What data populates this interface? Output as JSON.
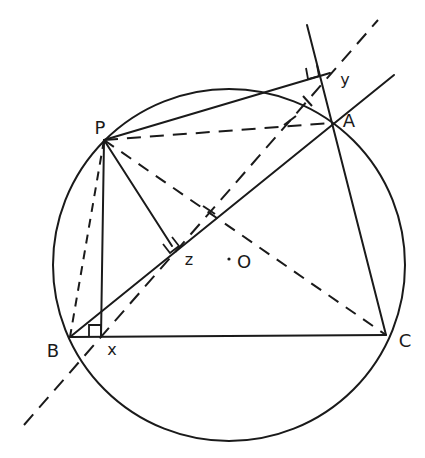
{
  "diagram": {
    "stroke_color": "#1a1a1a",
    "background": "#ffffff",
    "circle": {
      "cx": 229,
      "cy": 265,
      "r": 176,
      "name": "circumcircle"
    },
    "center": {
      "x": 229,
      "y": 259,
      "label": "O",
      "label_x": 244,
      "label_y": 262
    },
    "points": [
      {
        "id": "P",
        "x": 104,
        "y": 140,
        "label": "P",
        "label_x": 100,
        "label_y": 128
      },
      {
        "id": "A",
        "x": 332,
        "y": 123,
        "label": "A",
        "label_x": 349,
        "label_y": 121
      },
      {
        "id": "B",
        "x": 70,
        "y": 337,
        "label": "B",
        "label_x": 53,
        "label_y": 351
      },
      {
        "id": "C",
        "x": 386,
        "y": 335,
        "label": "C",
        "label_x": 405,
        "label_y": 341
      },
      {
        "id": "X",
        "x": 101,
        "y": 337,
        "label": "x",
        "label_x": 112,
        "label_y": 350
      },
      {
        "id": "Y",
        "x": 330,
        "y": 73,
        "label": "y",
        "label_x": 345,
        "label_y": 80
      },
      {
        "id": "Z",
        "x": 172,
        "y": 246,
        "label": "z",
        "label_x": 189,
        "label_y": 260
      }
    ],
    "solid_lines": [
      {
        "name": "side-bc",
        "x1": 70,
        "y1": 337,
        "x2": 386,
        "y2": 335
      },
      {
        "name": "side-ab-extended",
        "x1": 70,
        "y1": 337,
        "x2": 394,
        "y2": 75
      },
      {
        "name": "side-ca-extended",
        "x1": 386,
        "y1": 335,
        "x2": 307,
        "y2": 25
      },
      {
        "name": "perp-px",
        "x1": 104,
        "y1": 140,
        "x2": 101,
        "y2": 337
      },
      {
        "name": "perp-pz",
        "x1": 104,
        "y1": 140,
        "x2": 172,
        "y2": 246
      },
      {
        "name": "perp-py",
        "x1": 104,
        "y1": 140,
        "x2": 330,
        "y2": 73
      }
    ],
    "dashed_lines": [
      {
        "name": "simson-line",
        "x1": 24,
        "y1": 425,
        "x2": 378,
        "y2": 20,
        "dash": "14 9"
      },
      {
        "name": "chord-pa",
        "x1": 104,
        "y1": 140,
        "x2": 332,
        "y2": 123,
        "dash": "14 9"
      },
      {
        "name": "chord-pc",
        "x1": 104,
        "y1": 140,
        "x2": 386,
        "y2": 335,
        "dash": "12 9"
      },
      {
        "name": "chord-pb",
        "x1": 104,
        "y1": 140,
        "x2": 70,
        "y2": 337,
        "dash": "9 7"
      }
    ],
    "right_angles": [
      {
        "name": "right-angle-x",
        "points": "89,337 89,325 101,325 101,337"
      },
      {
        "name": "right-angle-z",
        "points": "163,244 170,253 179,246 172,237"
      },
      {
        "name": "right-angle-y",
        "points": "306,68 308,79 319,76 317,65"
      }
    ],
    "tick_marks": [
      {
        "name": "tick-simson-pc",
        "x1": 203,
        "y1": 206,
        "x2": 215,
        "y2": 214
      },
      {
        "name": "tick-simson-circle",
        "x1": 303,
        "y1": 96,
        "x2": 312,
        "y2": 106
      },
      {
        "name": "tick-pa-arrow",
        "x1": 284,
        "y1": 125,
        "x2": 296,
        "y2": 116
      }
    ]
  }
}
